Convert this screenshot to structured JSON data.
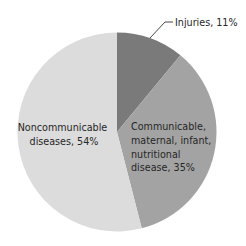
{
  "chart_data": {
    "type": "pie",
    "title": "",
    "start_angle_deg": 0,
    "direction": "clockwise",
    "slices": [
      {
        "label": "Injuries",
        "value": 11,
        "color": "#7a7a7a",
        "display": [
          "Injuries, 11%"
        ]
      },
      {
        "label": "Communicable, maternal, infant, nutritional disease",
        "value": 35,
        "color": "#a3a3a3",
        "display": [
          "Communicable,",
          "maternal, infant,",
          "nutritional",
          "disease, 35%"
        ]
      },
      {
        "label": "Noncommunicable diseases",
        "value": 54,
        "color": "#dcdcdc",
        "display": [
          "Noncommunicable",
          "diseases, 54%"
        ]
      }
    ],
    "legend": "none",
    "annotation_leader_line": "Injuries, 11%"
  },
  "labels": {
    "injuries": "Injuries, 11%",
    "communicable": [
      "Communicable,",
      "maternal, infant,",
      "nutritional",
      "disease, 35%"
    ],
    "noncommunicable": [
      "Noncommunicable",
      "diseases, 54%"
    ]
  }
}
